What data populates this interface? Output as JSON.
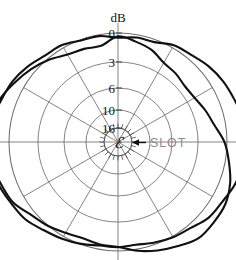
{
  "figure": {
    "axis_title": "dB",
    "center_symbol": "ℰ",
    "annotation_label": "SLOT",
    "arrow_icon": "left-arrow-icon"
  },
  "chart_data": {
    "type": "line",
    "subtype": "polar-radiation-pattern",
    "title": "dB",
    "xlabel": "",
    "ylabel": "dB",
    "grid": true,
    "legend": "none",
    "annotations": [
      {
        "text": "SLOT",
        "kind": "pointer-label",
        "points_to": "center",
        "color": "#8a8a8a"
      },
      {
        "text": "ℰ",
        "kind": "center-symbol",
        "meaning": "electric-field-vector"
      }
    ],
    "radial_axis": {
      "label": "dB",
      "tick_labels": [
        "0",
        "3",
        "6",
        "10",
        "16"
      ],
      "tick_values": [
        0,
        3,
        6,
        10,
        16
      ],
      "direction": "inward",
      "note": "0 dB at outer ring, attenuation increases toward center"
    },
    "angular_axis": {
      "spoke_interval_deg": 30,
      "spoke_count": 12,
      "zero_at": "top",
      "tick_labels": []
    },
    "series": [
      {
        "name": "pattern-outer",
        "closed": true,
        "units": "dB below 0 dB reference",
        "angles_deg": [
          0,
          10,
          20,
          30,
          40,
          50,
          60,
          70,
          80,
          90,
          100,
          110,
          120,
          130,
          140,
          150,
          160,
          170,
          180,
          190,
          200,
          210,
          220,
          230,
          240,
          250,
          260,
          270,
          280,
          290,
          300,
          310,
          320,
          330,
          340,
          350
        ],
        "values_db": [
          0.4,
          0.2,
          0.1,
          -0.3,
          -0.6,
          -0.9,
          -1.2,
          -1.5,
          -1.7,
          -1.8,
          -1.7,
          -1.5,
          -1.2,
          -0.9,
          -0.5,
          -0.2,
          0.1,
          0.3,
          0.4,
          0.3,
          0.1,
          -0.2,
          -0.6,
          -1.0,
          -1.4,
          -1.7,
          -1.9,
          -2.0,
          -1.9,
          -1.7,
          -1.4,
          -1.0,
          -0.6,
          -0.3,
          0.0,
          0.2
        ]
      },
      {
        "name": "pattern-inner",
        "closed": true,
        "units": "dB below 0 dB reference",
        "angles_deg": [
          0,
          10,
          20,
          30,
          40,
          50,
          60,
          70,
          80,
          90,
          100,
          110,
          120,
          130,
          140,
          150,
          160,
          170,
          180,
          190,
          200,
          210,
          220,
          230,
          240,
          250,
          260,
          270,
          280,
          290,
          300,
          310,
          320,
          330,
          340,
          350
        ],
        "values_db": [
          0.4,
          0.8,
          1.2,
          1.7,
          2.0,
          2.1,
          2.0,
          1.6,
          1.0,
          0.3,
          -0.4,
          -1.0,
          -1.4,
          -1.6,
          -1.5,
          -1.1,
          -0.6,
          -0.1,
          0.3,
          0.5,
          0.5,
          0.3,
          -0.1,
          -0.6,
          -1.2,
          -1.6,
          -1.9,
          -2.0,
          -1.8,
          -1.5,
          -1.0,
          -0.4,
          0.2,
          0.7,
          1.0,
          1.0
        ]
      }
    ]
  },
  "geometry": {
    "center_x": 118,
    "center_y": 142,
    "ring_radii_px": [
      109,
      80,
      54,
      32,
      14
    ],
    "hub_radius_px": 14
  },
  "colors": {
    "curve": "#111111",
    "grid": "#6e6e6e",
    "label": "#141414",
    "annotation": "#8a8a8a",
    "background": "#ffffff"
  }
}
